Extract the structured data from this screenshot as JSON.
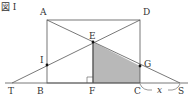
{
  "figure": {
    "title": "図 I",
    "labels": {
      "A": "A",
      "B": "B",
      "C": "C",
      "D": "D",
      "E": "E",
      "F": "F",
      "G": "G",
      "I": "I",
      "T": "T",
      "S": "S",
      "x": "x"
    },
    "points": {
      "A": [
        47,
        20
      ],
      "D": [
        140,
        20
      ],
      "B": [
        47,
        83
      ],
      "C": [
        140,
        83
      ],
      "E": [
        93,
        42
      ],
      "F": [
        93,
        83
      ],
      "G": [
        140,
        66
      ],
      "I": [
        47,
        65
      ],
      "T": [
        12,
        83
      ],
      "S": [
        180,
        83
      ]
    },
    "shaded_region": [
      "E",
      "F",
      "C",
      "G"
    ],
    "colors": {
      "line": "#555555",
      "shade": "#b8b8b8",
      "point": "#111111"
    }
  }
}
